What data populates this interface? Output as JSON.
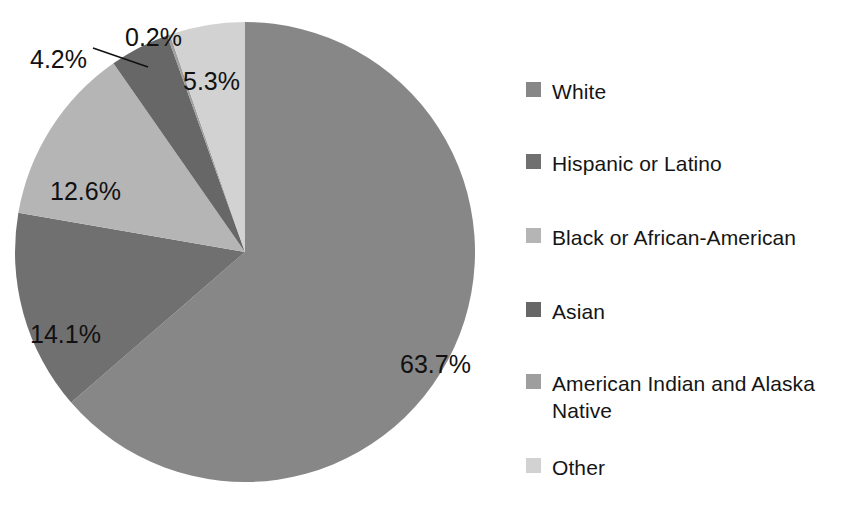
{
  "chart_data": {
    "type": "pie",
    "title": "",
    "subtitle": "",
    "xlabel": "",
    "ylabel": "",
    "legend_position": "right",
    "grid": false,
    "start_angle_deg": 0,
    "direction": "clockwise",
    "categories": [
      "White",
      "Hispanic or Latino",
      "Black or African-American",
      "Asian",
      "American Indian and Alaska Native",
      "Other"
    ],
    "values": [
      63.7,
      14.1,
      12.6,
      4.2,
      0.2,
      5.3
    ],
    "value_labels": [
      "63.7%",
      "14.1%",
      "12.6%",
      "4.2%",
      "0.2%",
      "5.3%"
    ],
    "colors": [
      "#878787",
      "#707070",
      "#b5b5b5",
      "#676767",
      "#9e9e9e",
      "#d2d2d2"
    ],
    "units": "percent"
  },
  "pie": {
    "center_x": 245,
    "center_y": 252,
    "radius": 230,
    "slices": [
      {
        "name": "White",
        "label": "63.7%",
        "value": 63.7,
        "color": "#878787",
        "label_x": 400,
        "label_y": 355,
        "leader": false
      },
      {
        "name": "Hispanic or Latino",
        "label": "14.1%",
        "value": 14.1,
        "color": "#707070",
        "label_x": 30,
        "label_y": 325,
        "leader": false
      },
      {
        "name": "Black or African-American",
        "label": "12.6%",
        "value": 12.6,
        "color": "#b5b5b5",
        "label_x": 50,
        "label_y": 182,
        "leader": false
      },
      {
        "name": "Asian",
        "label": "4.2%",
        "value": 4.2,
        "color": "#676767",
        "label_x": 30,
        "label_y": 50,
        "leader": true
      },
      {
        "name": "American Indian and Alaska Native",
        "label": "0.2%",
        "value": 0.2,
        "color": "#9e9e9e",
        "label_x": 125,
        "label_y": 28,
        "leader": false
      },
      {
        "name": "Other",
        "label": "5.3%",
        "value": 5.3,
        "color": "#d2d2d2",
        "label_x": 183,
        "label_y": 72,
        "leader": false
      }
    ]
  },
  "legend": {
    "items": [
      {
        "label": "White",
        "color": "#878787",
        "top": 16
      },
      {
        "label": "Hispanic or Latino",
        "color": "#707070",
        "top": 88
      },
      {
        "label": "Black or African-American",
        "color": "#b5b5b5",
        "top": 162
      },
      {
        "label": "Asian",
        "color": "#676767",
        "top": 236
      },
      {
        "label": "American Indian and Alaska\nNative",
        "color": "#9e9e9e",
        "top": 308
      },
      {
        "label": "Other",
        "color": "#d2d2d2",
        "top": 392
      }
    ]
  }
}
